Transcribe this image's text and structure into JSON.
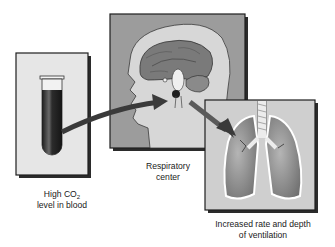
{
  "diagram": {
    "panels": [
      {
        "id": "blood",
        "label_line1_prefix": "High CO",
        "label_line1_sub": "2",
        "label_line2": "level in blood",
        "icon": "test-tube-icon"
      },
      {
        "id": "brain",
        "label_line1": "Respiratory",
        "label_line2": "center",
        "icon": "brain-icon"
      },
      {
        "id": "lungs",
        "label_line1": "Increased rate and depth",
        "label_line2": "of ventilation",
        "icon": "lungs-icon"
      }
    ],
    "arrows": [
      {
        "from": "blood",
        "to": "brain"
      },
      {
        "from": "brain",
        "to": "lungs"
      }
    ],
    "colors": {
      "panel_border": "#1e1e1e",
      "blood_panel_fill": "#e6e6e6",
      "brain_panel_fill": "#9c9c9c",
      "head_fill": "#d7d7d7",
      "brain_fill": "#7a7a7a",
      "lung_fill": "#8a8a8a",
      "lungs_panel_fill": "#cfcfcf",
      "arrow": "#3a3a3a",
      "blood": "#2a2a2a"
    }
  }
}
